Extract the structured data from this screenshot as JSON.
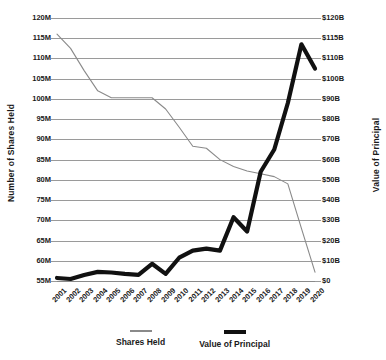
{
  "chart_data": {
    "type": "line",
    "title": "",
    "xlabel": "",
    "ylabel": "Number of Shares Held",
    "y2label": "Value of Principal",
    "grid": true,
    "legend_position": "bottom",
    "x": [
      "2001",
      "2002",
      "2003",
      "2004",
      "2005",
      "2006",
      "2007",
      "2008",
      "2009",
      "2010",
      "2011",
      "2012",
      "2013",
      "2014",
      "2015",
      "2016",
      "2017",
      "2018",
      "2019",
      "2020"
    ],
    "categories": [
      "2001",
      "2002",
      "2003",
      "2004",
      "2005",
      "2006",
      "2007",
      "2008",
      "2009",
      "2010",
      "2011",
      "2012",
      "2013",
      "2014",
      "2015",
      "2016",
      "2017",
      "2018",
      "2019",
      "2020"
    ],
    "ylim": [
      55,
      120
    ],
    "yticks": [
      120,
      115,
      110,
      105,
      100,
      95,
      90,
      85,
      80,
      75,
      70,
      65,
      60,
      55
    ],
    "ytick_labels": [
      "120M",
      "115M",
      "110M",
      "105M",
      "100M",
      "95M",
      "90M",
      "85M",
      "80M",
      "75M",
      "70M",
      "65M",
      "60M",
      "55M"
    ],
    "y2tick_labels": [
      "$120B",
      "$115B",
      "$110B",
      "$100B",
      "$90B",
      "$80B",
      "$70B",
      "$60B",
      "$50B",
      "$40B",
      "$30B",
      "$20B",
      "$10B",
      "$0"
    ],
    "series": [
      {
        "name": "Shares Held",
        "axis": "left",
        "unit": "M shares",
        "color": "#8a8a8a",
        "values": [
          116.0,
          112.5,
          107.0,
          102.0,
          100.3,
          100.3,
          100.3,
          100.3,
          97.5,
          93.0,
          88.3,
          87.8,
          85.0,
          83.3,
          82.2,
          81.5,
          80.8,
          79.0,
          68.0,
          57.2
        ]
      },
      {
        "name": "Value of Principal",
        "axis": "right",
        "unit": "B dollars",
        "color": "#111111",
        "values": [
          1.5,
          1.0,
          3.0,
          4.5,
          4.2,
          3.5,
          3.0,
          8.5,
          3.5,
          11.5,
          15.0,
          16.0,
          15.0,
          31.5,
          24.5,
          54.0,
          65.0,
          88.0,
          113.5,
          105.0
        ]
      }
    ]
  },
  "legend": {
    "items": [
      {
        "label": "Shares Held",
        "swatch": "thin-line-swatch"
      },
      {
        "label": "Value of Principal",
        "swatch": "thick-line-swatch"
      }
    ]
  },
  "axes": {
    "left_title": "Number of Shares Held",
    "right_title": "Value of Principal"
  }
}
